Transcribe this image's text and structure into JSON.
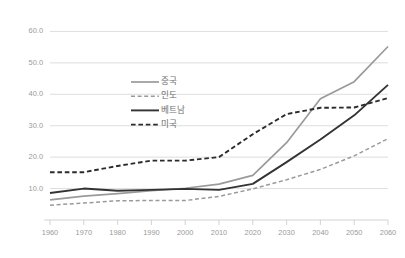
{
  "chart_data": {
    "type": "line",
    "title": "",
    "subtitle": "",
    "xlabel": "",
    "ylabel": "",
    "x": [
      1960,
      1970,
      1980,
      1990,
      2000,
      2010,
      2020,
      2030,
      2040,
      2050,
      2060
    ],
    "xlim": [
      1960,
      2060
    ],
    "ylim": [
      0,
      63
    ],
    "yticks": [
      10.0,
      20.0,
      30.0,
      40.0,
      50.0,
      60.0
    ],
    "ytick_labels": [
      "10.0",
      "20.0",
      "30.0",
      "40.0",
      "50.0",
      "60.0"
    ],
    "xticks": [
      1960,
      1970,
      1980,
      1990,
      2000,
      2010,
      2020,
      2030,
      2040,
      2050,
      2060
    ],
    "xtick_labels": [
      "1960",
      "1970",
      "1980",
      "1990",
      "2000",
      "2010",
      "2020",
      "2030",
      "2040",
      "2050",
      "2060"
    ],
    "grid": true,
    "grid_axis": "y",
    "legend_position": "center-left-inside",
    "series": [
      {
        "name": "중국",
        "color": "#9a9a9a",
        "style": "solid",
        "width": 1.7,
        "values": [
          6.4,
          7.6,
          8.4,
          9.3,
          10.1,
          11.4,
          14.2,
          24.6,
          38.6,
          44.0,
          55.2
        ]
      },
      {
        "name": "인도",
        "color": "#9a9a9a",
        "style": "dashed",
        "width": 1.5,
        "values": [
          4.7,
          5.4,
          6.1,
          6.2,
          6.2,
          7.5,
          9.9,
          12.8,
          16.1,
          20.4,
          25.9
        ]
      },
      {
        "name": "베트남",
        "color": "#333333",
        "style": "solid",
        "width": 1.9,
        "values": [
          8.6,
          10.0,
          9.3,
          9.6,
          9.9,
          9.6,
          11.5,
          18.4,
          25.6,
          33.3,
          43.0
        ]
      },
      {
        "name": "미국",
        "color": "#2b2b2b",
        "style": "dashed",
        "width": 1.9,
        "values": [
          15.2,
          15.2,
          17.2,
          18.9,
          18.9,
          20.0,
          27.3,
          33.7,
          35.7,
          35.8,
          38.8
        ]
      }
    ]
  },
  "legend": {
    "items": [
      {
        "label": "중국"
      },
      {
        "label": "인도"
      },
      {
        "label": "베트남"
      },
      {
        "label": "미국"
      }
    ]
  },
  "colors": {
    "background": "#ffffff",
    "gridline": "#d6d6d6",
    "axis": "#c8c8c8",
    "tick_text": "#9a9a9a",
    "legend_text": "#6e6e6e",
    "series_light": "#9a9a9a",
    "series_dark": "#2b2b2b"
  }
}
